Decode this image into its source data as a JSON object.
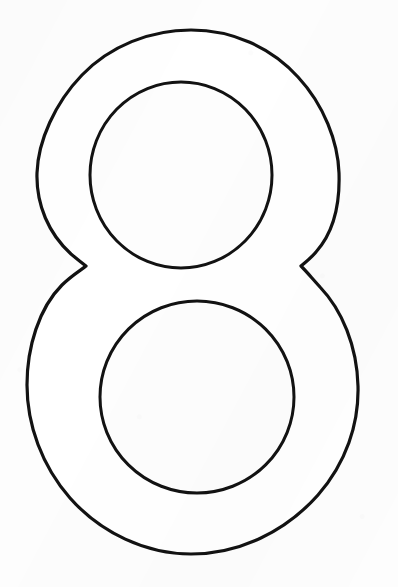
{
  "page": {
    "kind": "coloring-page-outline",
    "visible_text": "",
    "width": 398,
    "height": 587
  },
  "canvas": {
    "background_color": "#fdfdfd",
    "ink_color": "#121212",
    "stroke_width": 3.2
  },
  "figure": {
    "name": "numeral-8-outline",
    "fill_color": "#ffffff",
    "stroke_color": "#121212",
    "outer_path": "M 191 30 C 148 30 107 47 79 77 C 51 107 38 144 37 172 C 36 203 48 233 70 254 C 76 260 82 263 86 266 C 81 270 72 275 63 284 C 40 307 27 346 27 384 C 27 424 41 465 69 497 C 100 532 145 554 191 554 C 239 554 285 531 317 495 C 345 463 358 424 357 386 C 356 346 342 310 320 287 C 311 277 306 271 301 266 C 305 263 310 259 315 253 C 334 233 340 203 339 173 C 338 143 325 107 299 78 C 272 47 233 30 191 30 Z",
    "upper_counter": {
      "cx": 181,
      "cy": 175,
      "rx": 91,
      "ry": 93
    },
    "lower_counter": {
      "cx": 197,
      "cy": 397,
      "rx": 97,
      "ry": 96
    },
    "waist_left_cusp": {
      "x": 86,
      "y": 266
    },
    "waist_right_cusp": {
      "x": 303,
      "y": 261
    },
    "outer_bounds": {
      "top": 30,
      "bottom": 554,
      "left": 27,
      "right": 375
    }
  }
}
